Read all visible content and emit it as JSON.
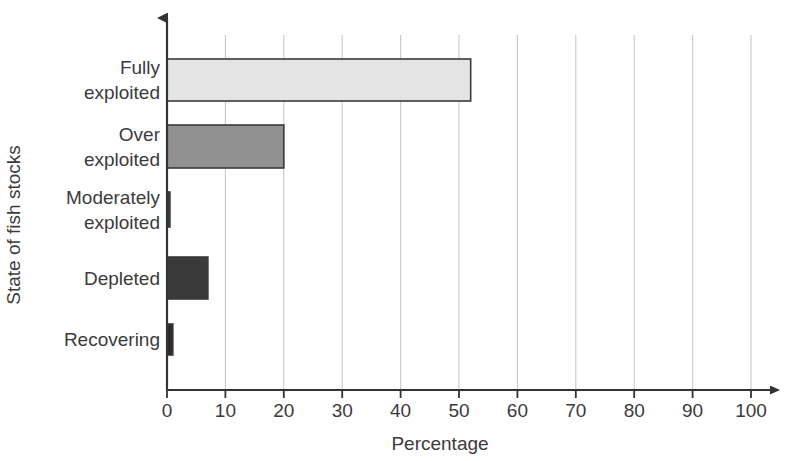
{
  "chart_data": {
    "type": "bar",
    "orientation": "horizontal",
    "title": "",
    "xlabel": "Percentage",
    "ylabel": "State of fish stocks",
    "categories": [
      "Fully exploited",
      "Over exploited",
      "Moderately exploited",
      "Depleted",
      "Recovering"
    ],
    "values": [
      52,
      20,
      0.5,
      7,
      1
    ],
    "xlim": [
      0,
      100
    ],
    "xticks": [
      0,
      10,
      20,
      30,
      40,
      50,
      60,
      70,
      80,
      90,
      100
    ],
    "xtick_labels": [
      "0",
      "10",
      "20",
      "30",
      "40",
      "50",
      "60",
      "70",
      "80",
      "90",
      "100"
    ],
    "grid": "vertical",
    "legend": "none",
    "bar_colors": [
      "#e4e4e4",
      "#919191",
      "#3a3a3a",
      "#3a3a3a",
      "#2c2c2c"
    ],
    "bar_edge_color": "#3a3a3a",
    "grid_color": "#c8c8c8",
    "axis_color": "#333333",
    "background": "#ffffff",
    "category_label_lines": [
      [
        "Fully",
        "exploited"
      ],
      [
        "Over",
        "exploited"
      ],
      [
        "Moderately",
        "exploited"
      ],
      [
        "Depleted"
      ],
      [
        "Recovering"
      ]
    ]
  }
}
